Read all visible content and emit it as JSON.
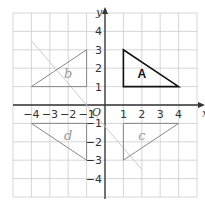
{
  "chart_data": {
    "type": "coordinate-grid",
    "title": "",
    "xlabel": "x",
    "ylabel": "y",
    "origin_label": "O",
    "xlim": [
      -5,
      5
    ],
    "ylim": [
      -5,
      5
    ],
    "x_ticks": [
      "-4",
      "-3",
      "-2",
      "-1",
      "1",
      "2",
      "3",
      "4"
    ],
    "y_ticks": [
      "4",
      "3",
      "2",
      "1",
      "-1",
      "-2",
      "-3",
      "-4"
    ],
    "grid": true,
    "shapes": [
      {
        "name": "A",
        "label": "A",
        "vertices": [
          [
            1,
            1
          ],
          [
            1,
            3
          ],
          [
            4,
            1
          ]
        ],
        "style": "printed"
      },
      {
        "name": "B",
        "label": "b",
        "vertices": [
          [
            -4,
            1
          ],
          [
            -1,
            3
          ],
          [
            -1,
            1
          ]
        ],
        "style": "handdrawn"
      },
      {
        "name": "C",
        "label": "c",
        "vertices": [
          [
            1,
            -1
          ],
          [
            1,
            -3
          ],
          [
            4,
            -1
          ]
        ],
        "style": "handdrawn"
      },
      {
        "name": "D",
        "label": "d",
        "vertices": [
          [
            -4,
            -1
          ],
          [
            -1,
            -3
          ],
          [
            -1,
            -1
          ]
        ],
        "style": "handdrawn"
      }
    ],
    "mirror_lines": [
      {
        "name": "faint-diagonal",
        "from": [
          -4,
          3.5
        ],
        "to": [
          2,
          -3.5
        ]
      }
    ]
  }
}
